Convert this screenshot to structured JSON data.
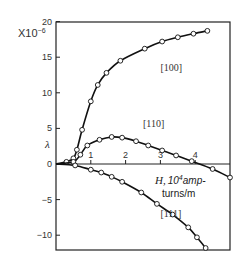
{
  "chart_data": {
    "type": "line",
    "title": "",
    "xlabel": "H, 10^4 amp-turns/m",
    "xlabel_lines": [
      "H,",
      "10",
      "4",
      "amp-",
      "turns/m"
    ],
    "ylabel": "λ",
    "y_multiplier": "X10",
    "y_multiplier_exp": "−6",
    "xlim": [
      0,
      5
    ],
    "ylim": [
      -12,
      20
    ],
    "x_ticks": [
      1,
      2,
      3,
      4
    ],
    "x_tick_labels": [
      "1",
      "2",
      "3",
      "4"
    ],
    "y_ticks": [
      20,
      15,
      10,
      5,
      0,
      -5,
      -10
    ],
    "y_tick_labels": [
      "20",
      "15",
      "10",
      "5",
      "0",
      "−5",
      "−10"
    ],
    "grid": false,
    "series": [
      {
        "name": "[100]",
        "x": [
          0,
          0.3,
          0.5,
          0.6,
          0.75,
          1.0,
          1.2,
          1.45,
          1.85,
          2.55,
          3.05,
          3.5,
          3.95,
          4.35
        ],
        "values": [
          0,
          0.3,
          0.8,
          2.0,
          4.8,
          8.8,
          11.1,
          12.8,
          14.5,
          16.2,
          17.2,
          17.8,
          18.3,
          18.7
        ],
        "markers_from": 1
      },
      {
        "name": "[110]",
        "x": [
          0,
          0.5,
          0.7,
          0.9,
          1.25,
          1.6,
          1.9,
          2.3,
          2.65,
          3.05,
          3.45,
          3.9,
          4.5,
          5.0
        ],
        "values": [
          0,
          0.3,
          1.3,
          2.6,
          3.4,
          3.8,
          3.7,
          3.2,
          2.6,
          1.9,
          1.2,
          0.4,
          -0.7,
          -1.9
        ],
        "markers_from": 1
      },
      {
        "name": "[111]",
        "x": [
          0,
          0.55,
          1.0,
          1.3,
          1.6,
          1.9,
          2.45,
          2.9,
          3.35,
          3.8,
          4.05,
          4.3
        ],
        "values": [
          0,
          -0.2,
          -0.8,
          -1.2,
          -1.8,
          -2.5,
          -4.0,
          -5.6,
          -7.1,
          -8.9,
          -10.3,
          -11.8
        ],
        "markers_from": 1
      }
    ],
    "annotations": [
      {
        "text": "[100]",
        "x": 3.0,
        "y": 13.0
      },
      {
        "text": "[110]",
        "x": 2.5,
        "y": 5.2
      },
      {
        "text": "[111]",
        "x": 3.0,
        "y": -7.4
      }
    ]
  }
}
